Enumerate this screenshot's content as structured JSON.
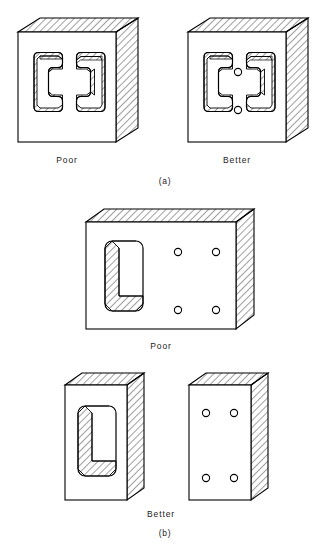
{
  "figure": {
    "background_color": "#ffffff",
    "line_color": "#000000",
    "hatch_color": "#000000"
  },
  "panels": [
    {
      "id": "a",
      "panel_label": "(a)",
      "items": [
        {
          "label": "Poor",
          "shape": "square block with two opposed C-shaped through channels",
          "features": "two mirrored bracket-shaped slots, no drilled holes"
        },
        {
          "label": "Better",
          "shape": "square block with two opposed C-shaped through channels plus two round holes",
          "features": "two mirrored bracket-shaped slots and two small drilled holes on center line"
        }
      ]
    },
    {
      "id": "b",
      "panel_label": "(b)",
      "items": [
        {
          "label": "Poor",
          "shape": "single wide rectangular block combining a large rounded slot and four drilled holes"
        },
        {
          "label": "Better",
          "shape": "two separate narrow blocks: one with rounded slot, one with four drilled holes"
        }
      ]
    }
  ],
  "captions": {
    "a_poor": "Poor",
    "a_better": "Better",
    "a_panel": "(a)",
    "b_poor": "Poor",
    "b_better": "Better",
    "b_panel": "(b)"
  },
  "geometry": {
    "hole_radius_px": 3.6,
    "hatch_spacing_px": 5.0,
    "hatch_angle_deg": 45,
    "depth_dx_px": 22,
    "depth_dy_px": -14
  }
}
